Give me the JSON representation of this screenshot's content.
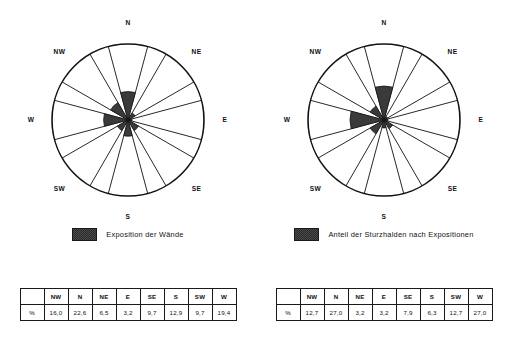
{
  "panels": [
    {
      "id": "panel-waende",
      "legend": {
        "label": "Exposition der Wände",
        "swatch_color": "#3a3a3a"
      },
      "directions": [
        "N",
        "NE",
        "E",
        "SE",
        "S",
        "SW",
        "W",
        "NW"
      ],
      "table": {
        "unit": "%",
        "headers": [
          "",
          "NW",
          "N",
          "NE",
          "E",
          "SE",
          "S",
          "SW",
          "W"
        ],
        "row_label": "%",
        "values": [
          "16,0",
          "22,6",
          "6,5",
          "3,2",
          "9,7",
          "12,9",
          "9,7",
          "19,4"
        ]
      }
    },
    {
      "id": "panel-sturzhalden",
      "legend": {
        "label": "Anteil der Sturzhalden nach Expositionen",
        "swatch_color": "#3a3a3a"
      },
      "directions": [
        "N",
        "NE",
        "E",
        "SE",
        "S",
        "SW",
        "W",
        "NW"
      ],
      "table": {
        "unit": "%",
        "headers": [
          "",
          "NW",
          "N",
          "NE",
          "E",
          "SE",
          "S",
          "SW",
          "W"
        ],
        "row_label": "%",
        "values": [
          "12,7",
          "27,0",
          "3,2",
          "3,2",
          "7,9",
          "6,3",
          "12,7",
          "27,0"
        ]
      }
    }
  ],
  "chart_data": [
    {
      "type": "pie",
      "subtype": "wind-rose",
      "title": "Exposition der Wände",
      "categories": [
        "N",
        "NE",
        "E",
        "SE",
        "S",
        "SW",
        "W",
        "NW"
      ],
      "values": [
        22.6,
        6.5,
        3.2,
        9.7,
        12.9,
        9.7,
        19.4,
        16.0
      ],
      "unit": "%",
      "max": 27.0,
      "sector_span_deg": 30,
      "outer_ring_deg": 45,
      "grid": false,
      "legend_position": "bottom",
      "fill_color": "#3a3a3a",
      "line_color": "#111111"
    },
    {
      "type": "pie",
      "subtype": "wind-rose",
      "title": "Anteil der Sturzhalden nach Expositionen",
      "categories": [
        "N",
        "NE",
        "E",
        "SE",
        "S",
        "SW",
        "W",
        "NW"
      ],
      "values": [
        27.0,
        3.2,
        3.2,
        7.9,
        6.3,
        12.7,
        27.0,
        12.7
      ],
      "unit": "%",
      "max": 27.0,
      "sector_span_deg": 30,
      "outer_ring_deg": 45,
      "grid": false,
      "legend_position": "bottom",
      "fill_color": "#3a3a3a",
      "line_color": "#111111"
    }
  ]
}
